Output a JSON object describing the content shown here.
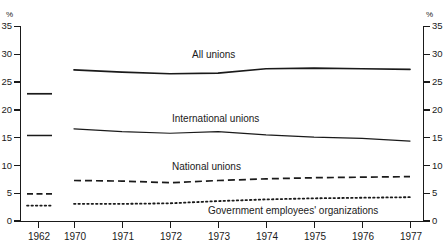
{
  "chart_data": {
    "type": "line",
    "title": "",
    "subtitle": "",
    "xlabel": "",
    "ylabel": "%",
    "ylabel_right": "%",
    "ylim": [
      0,
      35
    ],
    "ytick_values": [
      0,
      5,
      10,
      15,
      20,
      25,
      30,
      35
    ],
    "ytick_labels": [
      "0",
      "5",
      "10",
      "15",
      "20",
      "25",
      "30",
      "35"
    ],
    "ytick_labels_right": [
      "0",
      "5",
      "10",
      "15",
      "20",
      "25",
      "30",
      "35"
    ],
    "grid": false,
    "legend_position": "inline-annotations",
    "x": [
      "1970",
      "1971",
      "1972",
      "1973",
      "1974",
      "1975",
      "1976",
      "1977"
    ],
    "xtick_labels": [
      "1962",
      "1970",
      "1971",
      "1972",
      "1973",
      "1974",
      "1975",
      "1976",
      "1977"
    ],
    "reference_year": "1962",
    "reference_values": {
      "All unions": 22.9,
      "International unions": 15.4,
      "National unions": 4.9,
      "Government employees' organizations": 2.8
    },
    "series": [
      {
        "name": "All unions",
        "style": "solid",
        "color": "#1a1a1a",
        "values": [
          27.2,
          26.8,
          26.5,
          26.6,
          27.4,
          27.5,
          27.4,
          27.3
        ],
        "ref_1962": 22.9
      },
      {
        "name": "International unions",
        "style": "solid",
        "color": "#1a1a1a",
        "values": [
          16.6,
          16.1,
          15.8,
          16.1,
          15.5,
          15.1,
          14.9,
          14.4
        ],
        "ref_1962": 15.4
      },
      {
        "name": "National unions",
        "style": "dashed",
        "color": "#1a1a1a",
        "values": [
          7.3,
          7.2,
          6.9,
          7.3,
          7.6,
          7.8,
          7.9,
          8.0
        ],
        "ref_1962": 4.9
      },
      {
        "name": "Government employees' organizations",
        "style": "dotted",
        "color": "#1a1a1a",
        "values": [
          3.1,
          3.1,
          3.2,
          3.6,
          3.9,
          4.1,
          4.2,
          4.3
        ],
        "ref_1962": 2.8
      }
    ],
    "annotations": [
      {
        "text": "All unions",
        "x": 192,
        "y": 52
      },
      {
        "text": "International unions",
        "x": 172,
        "y": 116
      },
      {
        "text": "National unions",
        "x": 172,
        "y": 164
      },
      {
        "text": "Government employees' organizations",
        "x": 208,
        "y": 208
      }
    ]
  },
  "axes": {
    "unit_left": "%",
    "unit_right": "%"
  }
}
